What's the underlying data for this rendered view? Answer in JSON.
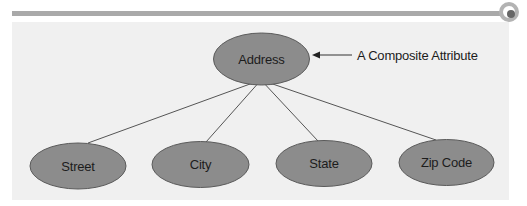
{
  "diagram": {
    "colors": {
      "page_background": "#ffffff",
      "panel_background": "#f0f0f0",
      "rule": "#a9a9a9",
      "node_fill": "#8c8c8c",
      "node_stroke": "#5a5a5a",
      "edge": "#555555",
      "text": "#1c1c1c"
    },
    "root": {
      "label": "Address"
    },
    "annotation": {
      "label": "A Composite Attribute"
    },
    "children": [
      {
        "label": "Street"
      },
      {
        "label": "City"
      },
      {
        "label": "State"
      },
      {
        "label": "Zip Code"
      }
    ]
  }
}
